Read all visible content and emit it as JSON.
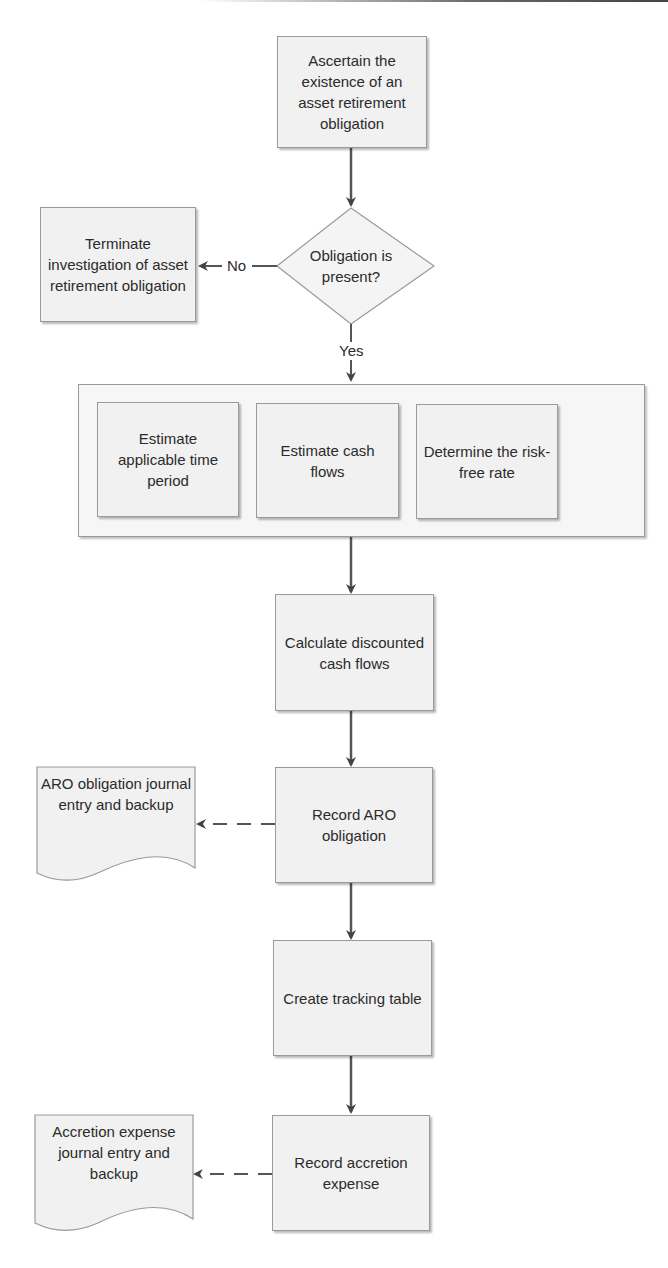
{
  "diagram": {
    "type": "flowchart",
    "colors": {
      "box_fill": "#f1f1f1",
      "border": "#9a9a9a",
      "arrow": "#444444",
      "text": "#2b2b2b"
    },
    "nodes": {
      "ascertain": "Ascertain the existence of an asset retirement obligation",
      "decision": "Obligation is present?",
      "terminate": "Terminate investigation of asset retirement obligation",
      "estimate_time": "Estimate applicable time period",
      "estimate_cash": "Estimate cash flows",
      "risk_free": "Determine the risk-free rate",
      "calculate": "Calculate discounted cash flows",
      "record_aro": "Record ARO obligation",
      "aro_doc": "ARO obligation journal entry and backup",
      "tracking": "Create tracking table",
      "record_accretion": "Record accretion expense",
      "accretion_doc": "Accretion expense journal entry and backup"
    },
    "edge_labels": {
      "no": "No",
      "yes": "Yes"
    }
  }
}
